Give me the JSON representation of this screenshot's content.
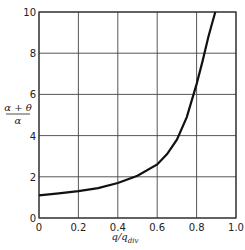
{
  "chart_data": {
    "type": "line",
    "title": "",
    "xlabel": "q/q_div",
    "ylabel": "(α + θ)/α",
    "xlim": [
      0,
      1.0
    ],
    "ylim": [
      0,
      10
    ],
    "grid": true,
    "legend": null,
    "x_ticks": [
      "0",
      "0.2",
      "0.4",
      "0.6",
      "0.8",
      "1.0"
    ],
    "y_ticks": [
      "0",
      "2",
      "4",
      "6",
      "8",
      "10"
    ],
    "series": [
      {
        "name": "curve",
        "x": [
          0,
          0.1,
          0.2,
          0.3,
          0.4,
          0.5,
          0.6,
          0.65,
          0.7,
          0.75,
          0.8,
          0.83,
          0.86,
          0.88,
          0.895
        ],
        "y": [
          1.1,
          1.2,
          1.3,
          1.45,
          1.7,
          2.05,
          2.6,
          3.1,
          3.8,
          4.9,
          6.5,
          7.6,
          8.8,
          9.5,
          10.0
        ]
      }
    ]
  },
  "labels": {
    "x_main": "q/q",
    "x_sub": "div",
    "y_num": "α + θ",
    "y_den": "α"
  }
}
